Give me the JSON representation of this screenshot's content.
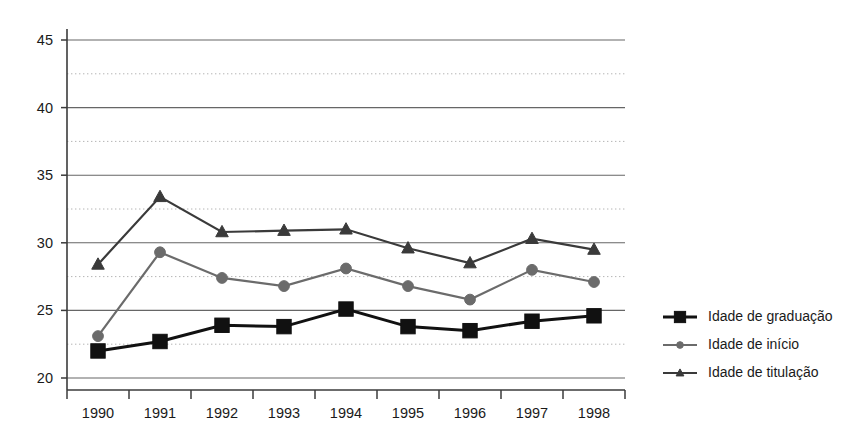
{
  "chart_data": {
    "type": "line",
    "title": "",
    "subtitle": "",
    "xlabel": "",
    "ylabel": "",
    "categories": [
      "1990",
      "1991",
      "1992",
      "1993",
      "1994",
      "1995",
      "1996",
      "1997",
      "1998"
    ],
    "ylim": [
      20,
      45
    ],
    "ytick_values": [
      20,
      25,
      30,
      35,
      40,
      45
    ],
    "ytick_labels": [
      "20",
      "25",
      "30",
      "35",
      "40",
      "45"
    ],
    "yminor_values": [
      22.5,
      27.5,
      32.5,
      37.5,
      42.5
    ],
    "grid": "major solid + minor dotted, horizontal only",
    "legend_position": "right",
    "series": [
      {
        "name": "Idade de graduação",
        "marker": "square",
        "color": "#111111",
        "values": [
          22.0,
          22.7,
          23.9,
          23.8,
          25.1,
          23.8,
          23.5,
          24.2,
          24.6
        ]
      },
      {
        "name": "Idade  de início",
        "marker": "circle",
        "color": "#6b6b6b",
        "values": [
          23.1,
          29.3,
          27.4,
          26.8,
          28.1,
          26.8,
          25.8,
          28.0,
          27.1
        ]
      },
      {
        "name": "Idade  de titulação",
        "marker": "triangle",
        "color": "#3a3a3a",
        "values": [
          28.4,
          33.4,
          30.8,
          30.9,
          31.0,
          29.6,
          28.5,
          30.3,
          29.5
        ]
      }
    ]
  },
  "legend": {
    "items": [
      {
        "label": "Idade de graduação",
        "marker": "square-marker",
        "color": "#111111"
      },
      {
        "label": "Idade  de início",
        "marker": "circle-marker",
        "color": "#6b6b6b"
      },
      {
        "label": "Idade  de titulação",
        "marker": "triangle-marker",
        "color": "#3a3a3a"
      }
    ]
  },
  "axes": {
    "y_axis_name": "vertical-axis",
    "x_axis_name": "horizontal-axis"
  },
  "colors": {
    "background": "#ffffff",
    "axis": "#3b3b3b",
    "grid_major": "#666666",
    "grid_minor": "#b4b4b4",
    "text": "#1a1a1a"
  }
}
